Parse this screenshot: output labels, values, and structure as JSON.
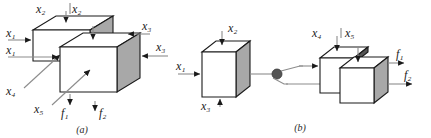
{
  "figure": {
    "caption_a": "(a)",
    "caption_b": "(b)",
    "colors": {
      "face_front": "#ffffff",
      "face_top": "#ffffff",
      "face_side": "#a8a8a8",
      "outline": "#1a1a1a",
      "arrow": "#8c8c8c",
      "arrow_head": "#1a1a1a",
      "junction": "#555555",
      "label": "#1a1a1a"
    }
  },
  "panel_a": {
    "name": "panel-a",
    "labels": {
      "x2_back": "x₂",
      "x2_front": "x₂",
      "x1_back": "x₁",
      "x1_front": "x₁",
      "x3_back": "x₃",
      "x3_front": "x₃",
      "x4": "x₄",
      "x5": "x₅",
      "f1": "f₁",
      "f2": "f₂"
    }
  },
  "panel_b": {
    "name": "panel-b",
    "labels": {
      "x1": "x₁",
      "x2": "x₂",
      "x3": "x₃",
      "x4": "x₄",
      "x5": "x₅",
      "f1": "f₁",
      "f2": "f₂"
    }
  }
}
